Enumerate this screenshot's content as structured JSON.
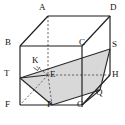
{
  "figure": {
    "type": "geometry-diagram",
    "background": "#ffffff",
    "stroke_solid": "#1a1a1a",
    "stroke_hidden": "#555555",
    "shade_fill": "#d4d4d4",
    "shade_stroke": "#333333",
    "canvas": {
      "width": 125,
      "height": 125
    }
  },
  "solid": {
    "name": "rectangular-prism",
    "vertices": [
      {
        "id": "A",
        "label": "A",
        "x": 48,
        "y": 16,
        "label_x": 39,
        "label_y": 4,
        "hidden": true
      },
      {
        "id": "B",
        "label": "B",
        "x": 20,
        "y": 46,
        "label_x": 6,
        "label_y": 38,
        "hidden": false
      },
      {
        "id": "C",
        "label": "C",
        "x": 82,
        "y": 46,
        "label_x": 80,
        "label_y": 38,
        "hidden": false
      },
      {
        "id": "D",
        "label": "D",
        "x": 110,
        "y": 16,
        "label_x": 110,
        "label_y": 4,
        "hidden": false
      },
      {
        "id": "E",
        "label": "E",
        "x": 48,
        "y": 75,
        "label_x": 50,
        "label_y": 68,
        "hidden": true
      },
      {
        "id": "F",
        "label": "F",
        "x": 20,
        "y": 105,
        "label_x": 6,
        "label_y": 105,
        "hidden": false
      },
      {
        "id": "G",
        "label": "G",
        "x": 82,
        "y": 105,
        "label_x": 78,
        "label_y": 105,
        "hidden": false
      },
      {
        "id": "H",
        "label": "H",
        "x": 110,
        "y": 75,
        "label_x": 112,
        "label_y": 71,
        "hidden": false
      }
    ],
    "edges_solid": [
      "B-C",
      "C-D",
      "B-F",
      "C-G",
      "D-H",
      "F-G",
      "G-H",
      "A-B",
      "A-D"
    ],
    "edges_hidden": [
      "A-E",
      "E-F",
      "E-H"
    ]
  },
  "points": [
    {
      "id": "T",
      "label": "T",
      "x": 20,
      "y": 78,
      "label_x": 6,
      "label_y": 70,
      "on": "edge BF"
    },
    {
      "id": "P",
      "label": "P",
      "x": 52,
      "y": 105,
      "label_x": 48,
      "label_y": 105,
      "on": "edge FG"
    },
    {
      "id": "S",
      "label": "S",
      "x": 110,
      "y": 49,
      "label_x": 112,
      "label_y": 40,
      "on": "edge DH"
    },
    {
      "id": "Q",
      "label": "Q",
      "x": 100,
      "y": 90,
      "label_x": 98,
      "label_y": 88,
      "on": "edge GH"
    },
    {
      "id": "K",
      "label": "K",
      "x": 38,
      "y": 68,
      "label_x": 33,
      "label_y": 56,
      "on": "segment TS"
    }
  ],
  "shaded_section": {
    "name": "cross-section-TSQP",
    "vertex_ids": [
      "T",
      "S",
      "Q",
      "P"
    ],
    "polygon": "20,78 110,49 100,90 52,105",
    "fill": "#d4d4d4",
    "opacity": 0.85
  },
  "construction_lines": [
    {
      "name": "segment-T-S",
      "from": "T",
      "to": "S",
      "style": "solid"
    },
    {
      "name": "segment-S-Q",
      "from": "S",
      "to": "Q",
      "style": "solid"
    },
    {
      "name": "segment-Q-P",
      "from": "Q",
      "to": "P",
      "style": "solid"
    },
    {
      "name": "segment-P-T",
      "from": "P",
      "to": "T",
      "style": "solid"
    },
    {
      "name": "segment-E-K",
      "from": "E",
      "to": "K",
      "style": "dashed"
    },
    {
      "name": "segment-E-P",
      "from": "E",
      "to": "P",
      "style": "dashed"
    },
    {
      "name": "segment-T-E",
      "from": "T",
      "to": "E",
      "style": "solid"
    },
    {
      "name": "segment-T-P",
      "from": "T",
      "to": "P",
      "style": "solid"
    },
    {
      "name": "segment-F-E",
      "from": "F",
      "to": "E",
      "style": "dashed"
    }
  ],
  "right_angle_marks": [
    {
      "name": "right-angle-at-K",
      "at": "K",
      "x": 35,
      "y": 66,
      "size": 5
    }
  ]
}
